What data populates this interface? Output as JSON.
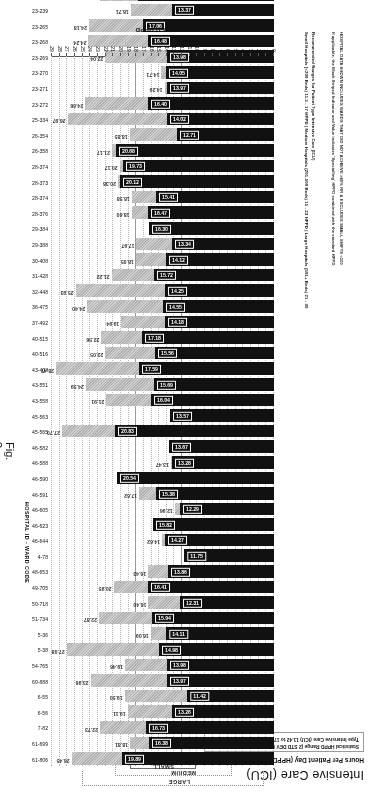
{
  "figure": {
    "title": "Intensive Care (ICU)",
    "subtitle": "Hours Per Patient Day (HPPD) \"Required\" (Acuity Measures)",
    "stat_box": "Statistical HPPD Range (2 STD DEV from MEAN) for Patient Type Intensive Care (ICU)  11.42 to 17.75 HPPD",
    "figure_label": "Fig. 3",
    "axis_title": "REQUIRED HPPD",
    "right_axis_caption": "HOSPITAL ID - WARD CODE",
    "note_line_1": "HOSPITAL DATA SHOWN INCLUDES WARDS THAT DID NOT ACHIEVE >80% RR & EXCLUDES SMALL SHIFTS <100",
    "note_line_2": "If applicable, the Black Striped Indicator and Value indicates 'Specialling' HPPD combined with the standard HPPD",
    "note_line_3": "Recommended Ranges for Patient Type Intensive Care (ICU)",
    "note_line_4": "Small Hospitals (<200 Beds) 11.5 - 17 HPPD | Medium Hospitals (201-500 Beds) 15 - 23 HPPD | Large Hospitals (501+ Beds) 21 - 30"
  },
  "brackets": [
    {
      "label": "LARGE"
    },
    {
      "label": "MEDIUM"
    },
    {
      "label": "SMALL"
    },
    {
      "label": "STAT HPPD"
    }
  ],
  "chart_data": {
    "type": "bar",
    "orientation": "horizontal",
    "xlabel": "REQUIRED HPPD",
    "ylabel": "HOSPITAL ID - WARD CODE",
    "xlim": [
      0,
      29
    ],
    "xticks": [
      0,
      1,
      2,
      3,
      4,
      5,
      6,
      7,
      8,
      9,
      10,
      11,
      12,
      13,
      14,
      15,
      16,
      17,
      18,
      19,
      20,
      21,
      22,
      23,
      24,
      25,
      26,
      27,
      28,
      29
    ],
    "grid": true,
    "stat_hppd_range": [
      11.42,
      17.75
    ],
    "series": [
      {
        "name": "Required HPPD (acuity)",
        "color": "#111111"
      },
      {
        "name": "Specialling HPPD combined",
        "color": "#c4c4c4"
      }
    ],
    "categories": [
      "61-806",
      "61-699",
      "7-82",
      "6-56",
      "6-55",
      "60-888",
      "54-765",
      "5-38",
      "5-36",
      "51-734",
      "50-718",
      "49-705",
      "48-653",
      "4-78",
      "46-644",
      "46-623",
      "46-605",
      "46-591",
      "46-590",
      "46-590b",
      "46-588",
      "46-582",
      "45-565",
      "45-563",
      "43-558",
      "43-551",
      "43-408",
      "40-516",
      "40-515",
      "37-492",
      "32-448",
      "31-428",
      "30-408",
      "29-388",
      "29-384",
      "28-376",
      "28-374",
      "28-373",
      "28-374b",
      "26-358",
      "26-354",
      "25-334",
      "23-272",
      "23-271",
      "23-270",
      "23-269",
      "23-268",
      "23-265",
      "23-239",
      "23-216",
      "18-159",
      "18-158",
      "16-158",
      "15-192",
      "14-146",
      "13-436",
      "1-3",
      "12-138",
      "11-133"
    ],
    "values_required": [
      19.89,
      16.38,
      16.73,
      13.26,
      11.42,
      13.97,
      13.98,
      14.98,
      14.11,
      15.94,
      12.31,
      16.41,
      13.86,
      11.75,
      14.27,
      15.82,
      12.29,
      15.38,
      20.54,
      13.28,
      13.67,
      20.83,
      13.57,
      16.04,
      15.69,
      17.59,
      15.56,
      17.18,
      14.18,
      14.55,
      14.25,
      15.72,
      14.12,
      13.34,
      16.3,
      16.47,
      15.41,
      20.12,
      19.73,
      20.68,
      12.71,
      14.02,
      16.4,
      13.97,
      14.05,
      16.48,
      17.06,
      13.37,
      17.75,
      14.8,
      15.19,
      15.6,
      14.22,
      21.13,
      13.11,
      15.35,
      17.23,
      15.95,
      14.0
    ],
    "values_total": [
      26.45,
      18.81,
      22.73,
      19.11,
      19.5,
      23.96,
      19.46,
      27.08,
      16.09,
      22.87,
      16.4,
      20.95,
      16.43,
      null,
      14.62,
      15.63,
      12.96,
      17.62,
      null,
      13.47,
      null,
      27.7,
      13.5,
      21.91,
      24.59,
      28.47,
      22.05,
      22.56,
      19.94,
      24.4,
      25.93,
      21.22,
      18.05,
      17.97,
      14.3,
      18.6,
      18.58,
      20.38,
      20.17,
      21.17,
      18.85,
      26.97,
      24.66,
      14.29,
      22.04,
      24.24,
      24.18,
      18.71,
      22.74,
      18.64,
      25.71,
      18.92,
      25.46,
      20.17,
      15.36,
      22.32,
      20.28,
      26.5,
      null
    ]
  },
  "rows": [
    {
      "ward": "61-806",
      "req": 19.89,
      "tot": 26.45
    },
    {
      "ward": "61-699",
      "req": 16.38,
      "tot": 18.81
    },
    {
      "ward": "7-82",
      "req": 16.73,
      "tot": 22.73
    },
    {
      "ward": "6-56",
      "req": 13.26,
      "tot": 19.11
    },
    {
      "ward": "6-55",
      "req": 11.42,
      "tot": 19.5
    },
    {
      "ward": "60-888",
      "req": 13.97,
      "tot": 23.96
    },
    {
      "ward": "54-765",
      "req": 13.98,
      "tot": 19.46
    },
    {
      "ward": "5-38",
      "req": 14.98,
      "tot": 27.08
    },
    {
      "ward": "5-36",
      "req": 14.11,
      "tot": 16.09
    },
    {
      "ward": "51-734",
      "req": 15.94,
      "tot": 22.87
    },
    {
      "ward": "50-718",
      "req": 12.31,
      "tot": 16.4
    },
    {
      "ward": "49-705",
      "req": 16.41,
      "tot": 20.95
    },
    {
      "ward": "48-653",
      "req": 13.86,
      "tot": 16.43
    },
    {
      "ward": "4-78",
      "req": 11.75,
      "tot": null
    },
    {
      "ward": "46-644",
      "req": 14.27,
      "tot": 14.62
    },
    {
      "ward": "46-623",
      "req": 15.82,
      "tot": 15.63
    },
    {
      "ward": "46-605",
      "req": 12.29,
      "tot": 12.96
    },
    {
      "ward": "46-591",
      "req": 15.38,
      "tot": 17.62
    },
    {
      "ward": "46-590",
      "req": 20.54,
      "tot": null
    },
    {
      "ward": "46-588",
      "req": 13.28,
      "tot": 13.47
    },
    {
      "ward": "46-582",
      "req": 13.67,
      "tot": null
    },
    {
      "ward": "45-565",
      "req": 20.83,
      "tot": 27.7
    },
    {
      "ward": "45-563",
      "req": 13.57,
      "tot": 13.5
    },
    {
      "ward": "43-558",
      "req": 16.04,
      "tot": 21.91
    },
    {
      "ward": "43-551",
      "req": 15.69,
      "tot": 24.59
    },
    {
      "ward": "43-408",
      "req": 17.59,
      "tot": 28.47
    },
    {
      "ward": "40-516",
      "req": 15.56,
      "tot": 22.05
    },
    {
      "ward": "40-515",
      "req": 17.18,
      "tot": 22.56
    },
    {
      "ward": "37-492",
      "req": 14.18,
      "tot": 19.94
    },
    {
      "ward": "36-475",
      "req": 14.55,
      "tot": 24.4
    },
    {
      "ward": "32-448",
      "req": 14.25,
      "tot": 25.93
    },
    {
      "ward": "31-428",
      "req": 15.72,
      "tot": 21.22
    },
    {
      "ward": "30-408",
      "req": 14.12,
      "tot": 18.05
    },
    {
      "ward": "29-388",
      "req": 13.34,
      "tot": 17.97
    },
    {
      "ward": "29-384",
      "req": 16.3,
      "tot": 14.3
    },
    {
      "ward": "28-376",
      "req": 16.47,
      "tot": 18.6
    },
    {
      "ward": "28-374",
      "req": 15.41,
      "tot": 18.58
    },
    {
      "ward": "28-373",
      "req": 20.12,
      "tot": 20.38
    },
    {
      "ward": "28-374",
      "req": 19.73,
      "tot": 20.17
    },
    {
      "ward": "26-358",
      "req": 20.68,
      "tot": 21.17
    },
    {
      "ward": "26-354",
      "req": 12.71,
      "tot": 18.85
    },
    {
      "ward": "25-334",
      "req": 14.02,
      "tot": 26.97
    },
    {
      "ward": "23-272",
      "req": 16.4,
      "tot": 24.66
    },
    {
      "ward": "23-271",
      "req": 13.97,
      "tot": 14.29
    },
    {
      "ward": "23-270",
      "req": 14.05,
      "tot": 14.71
    },
    {
      "ward": "23-269",
      "req": 13.98,
      "tot": 22.04
    },
    {
      "ward": "23-268",
      "req": 16.48,
      "tot": 24.24
    },
    {
      "ward": "23-265",
      "req": 17.06,
      "tot": 24.18
    },
    {
      "ward": "23-239",
      "req": 13.37,
      "tot": 18.71
    },
    {
      "ward": "23-216",
      "req": 17.75,
      "tot": 22.74
    },
    {
      "ward": "19-190",
      "req": 14.8,
      "tot": 18.64
    },
    {
      "ward": "18-159",
      "req": 15.19,
      "tot": 25.71
    },
    {
      "ward": "18-158",
      "req": 15.6,
      "tot": 18.92
    },
    {
      "ward": "16-158",
      "req": 14.22,
      "tot": 25.46
    },
    {
      "ward": "15-192",
      "req": 21.13,
      "tot": 26.17
    },
    {
      "ward": "14-146",
      "req": 13.11,
      "tot": 15.36
    },
    {
      "ward": "13-436",
      "req": 15.35,
      "tot": 22.32
    },
    {
      "ward": "1-3",
      "req": 17.23,
      "tot": 20.28
    },
    {
      "ward": "12-138",
      "req": 15.95,
      "tot": 26.5
    },
    {
      "ward": "11-133",
      "req": 14.0,
      "tot": null
    }
  ],
  "axis_ticks": [
    "29",
    "28",
    "27",
    "26",
    "25",
    "24",
    "23",
    "22",
    "21",
    "20",
    "19",
    "18",
    "17",
    "16",
    "15",
    "14",
    "13",
    "12",
    "11",
    "10",
    "9",
    "8",
    "7",
    "6",
    "5",
    "4",
    "3",
    "2",
    "1",
    "0"
  ]
}
